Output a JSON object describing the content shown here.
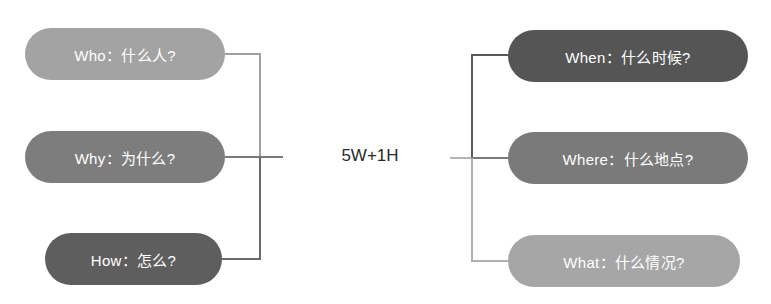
{
  "center": {
    "label": "5W+1H"
  },
  "left": [
    {
      "label": "Who：什么人?",
      "color": "#a3a3a3"
    },
    {
      "label": "Why：为什么?",
      "color": "#7d7d7d"
    },
    {
      "label": "How：怎么?",
      "color": "#5e5e5e"
    }
  ],
  "right": [
    {
      "label": "When：什么时候?",
      "color": "#555555"
    },
    {
      "label": "Where：什么地点?",
      "color": "#7a7a7a"
    },
    {
      "label": "What：什么情况?",
      "color": "#a6a6a6"
    }
  ],
  "connectors": {
    "left_upper": "#a0a0a0",
    "left_lower": "#6a6a6a",
    "left_mid": "#7a7a7a",
    "right_upper": "#5a5a5a",
    "right_lower": "#b0b0b0",
    "right_mid": "#7a7a7a",
    "right_stub": "#b5b5b5"
  }
}
